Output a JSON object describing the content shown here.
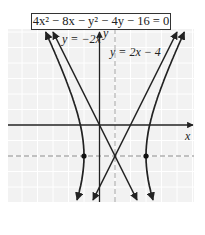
{
  "chart_data": {
    "type": "line",
    "title": "4x² − 8x − y² − 4y − 16 = 0",
    "equation": "4x^2 - 8x - y^2 - 4y - 16 = 0",
    "standard_form": "(x-1)^2/4 - (y+2)^2/16 = 1",
    "center": [
      1,
      -2
    ],
    "vertices": [
      [
        -1,
        -2
      ],
      [
        3,
        -2
      ]
    ],
    "asymptotes": [
      {
        "label": "y = −2x",
        "slope": -2,
        "intercept": 0
      },
      {
        "label": "y = 2x − 4",
        "slope": 2,
        "intercept": -4
      }
    ],
    "dashed_lines": [
      {
        "orientation": "horizontal",
        "value": -2
      },
      {
        "orientation": "vertical",
        "value": 1
      }
    ],
    "series": [
      {
        "name": "hyperbola-left-branch",
        "style": "solid-curve"
      },
      {
        "name": "hyperbola-right-branch",
        "style": "solid-curve"
      },
      {
        "name": "asymptote y=-2x",
        "style": "solid-line"
      },
      {
        "name": "asymptote y=2x-4",
        "style": "solid-line"
      }
    ],
    "xlabel": "x",
    "ylabel": "y",
    "xlim": [
      -6,
      6
    ],
    "ylim": [
      -5,
      6
    ],
    "grid": true,
    "ticks_labeled": false
  },
  "labels": {
    "equation_box": "4x² − 8x − y² − 4y − 16 = 0",
    "asymptote_left": "y = −2x",
    "asymptote_right": "y = 2x − 4",
    "x_axis": "x",
    "y_axis": "y"
  },
  "colors": {
    "curve": "#222222",
    "grid": "#e4e4e4",
    "grid_bg": "#f2f2f2",
    "dashed": "#888888"
  }
}
